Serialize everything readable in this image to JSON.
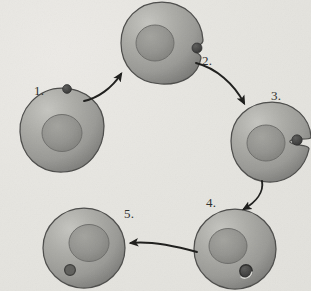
{
  "diagram": {
    "background_color": "#e6e5e0",
    "cell_body_color": "#9d9d99",
    "cell_highlight_color": "#c2c2bd",
    "cell_shadow_color": "#6f6f6c",
    "nucleus_color": "#8a8a86",
    "particle_color": "#3f3f3e",
    "outline_color": "#4a4a48",
    "arrow_color": "#1c1c1a",
    "labels": [
      {
        "id": "label-top",
        "text": "",
        "step": 0
      },
      {
        "id": "label-1",
        "text": "1.",
        "step": 1
      },
      {
        "id": "label-2",
        "text": "2.",
        "step": 2
      },
      {
        "id": "label-3",
        "text": "3.",
        "step": 3
      },
      {
        "id": "label-4",
        "text": "4.",
        "step": 4
      },
      {
        "id": "label-5",
        "text": "5.",
        "step": 5
      }
    ],
    "cells": [
      {
        "name": "cell-stage-1",
        "step": 1,
        "center": [
          62,
          130
        ],
        "radius": 42,
        "shape": "irregular-blob",
        "nucleus_center": [
          62,
          133
        ],
        "nucleus_radius": 19,
        "particle": {
          "inside": false,
          "center": [
            67,
            89
          ],
          "radius": 4
        },
        "notch": false
      },
      {
        "name": "cell-stage-2",
        "step": 2,
        "center": [
          162,
          43
        ],
        "radius": 40,
        "shape": "round-notched",
        "nucleus_center": [
          155,
          43
        ],
        "nucleus_radius": 18,
        "particle": {
          "inside": false,
          "center": [
            196,
            47
          ],
          "radius": 5
        },
        "notch": true
      },
      {
        "name": "cell-stage-3",
        "step": 3,
        "center": [
          272,
          142
        ],
        "radius": 40,
        "shape": "round-deep-notched",
        "nucleus_center": [
          265,
          143
        ],
        "nucleus_radius": 18,
        "particle": {
          "inside": false,
          "center": [
            295,
            139
          ],
          "radius": 5
        },
        "notch": true
      },
      {
        "name": "cell-stage-4",
        "step": 4,
        "center": [
          235,
          249
        ],
        "radius": 40,
        "shape": "round",
        "nucleus_center": [
          228,
          246
        ],
        "nucleus_radius": 18,
        "particle": {
          "inside": true,
          "center": [
            246,
            270
          ],
          "radius": 6
        },
        "notch": false
      },
      {
        "name": "cell-stage-5",
        "step": 5,
        "center": [
          84,
          248
        ],
        "radius": 40,
        "shape": "round",
        "nucleus_center": [
          88,
          243
        ],
        "nucleus_radius": 19,
        "particle": {
          "inside": true,
          "center": [
            70,
            270
          ],
          "radius": 5
        },
        "notch": false
      }
    ],
    "arrows": [
      {
        "name": "arrow-1-to-2",
        "from_step": 1,
        "to_step": 2,
        "start": [
          84,
          100
        ],
        "end": [
          123,
          72
        ],
        "direction": "up-right"
      },
      {
        "name": "arrow-2-to-3",
        "from_step": 2,
        "to_step": 3,
        "start": [
          196,
          62
        ],
        "end": [
          246,
          106
        ],
        "direction": "down-right"
      },
      {
        "name": "arrow-3-to-4",
        "from_step": 3,
        "to_step": 4,
        "start": [
          262,
          181
        ],
        "end": [
          242,
          212
        ],
        "direction": "down-left"
      },
      {
        "name": "arrow-4-to-5",
        "from_step": 4,
        "to_step": 5,
        "start": [
          196,
          252
        ],
        "end": [
          128,
          243
        ],
        "direction": "left"
      }
    ]
  }
}
